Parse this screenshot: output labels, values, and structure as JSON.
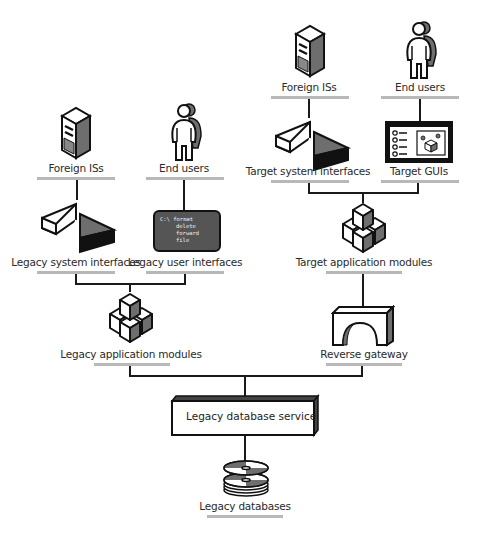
{
  "diagram": {
    "type": "architecture",
    "colors": {
      "line": "#1a1a1a",
      "underline": "#b8b8b8",
      "shade": "#6e6e6e",
      "dark": "#111111",
      "terminal": "#555555"
    },
    "left_column": {
      "foreign_iss": {
        "label": "Foreign ISs",
        "icon": "server-tower-icon"
      },
      "end_users": {
        "label": "End users",
        "icon": "user-person-icon"
      },
      "legacy_system_interfaces": {
        "label": "Legacy system interfaces",
        "icon": "interface-wedge-icon"
      },
      "legacy_user_interfaces": {
        "label": "Legacy user interfaces",
        "icon": "terminal-screen-icon",
        "terminal_lines": [
          "C:\\ format",
          "delete",
          "forward",
          "file"
        ]
      },
      "legacy_application_modules": {
        "label": "Legacy application modules",
        "icon": "stacked-cubes-icon"
      }
    },
    "right_column": {
      "foreign_iss": {
        "label": "Foreign ISs",
        "icon": "server-tower-icon"
      },
      "end_users": {
        "label": "End users",
        "icon": "user-person-icon"
      },
      "target_system_interfaces": {
        "label": "Target system interfaces",
        "icon": "interface-wedge-icon"
      },
      "target_guis": {
        "label": "Target GUIs",
        "icon": "gui-window-icon"
      },
      "target_application_modules": {
        "label": "Target application modules",
        "icon": "stacked-cubes-icon"
      },
      "reverse_gateway": {
        "label": "Reverse gateway",
        "icon": "gateway-arch-icon"
      }
    },
    "bottom": {
      "legacy_database_service": {
        "label": "Legacy database service",
        "icon": "service-box-icon"
      },
      "legacy_databases": {
        "label": "Legacy databases",
        "icon": "disk-stack-icon"
      }
    },
    "connections": [
      [
        "Foreign ISs (left)",
        "Legacy system interfaces"
      ],
      [
        "End users (left)",
        "Legacy user interfaces"
      ],
      [
        "Legacy system interfaces",
        "Legacy application modules"
      ],
      [
        "Legacy user interfaces",
        "Legacy application modules"
      ],
      [
        "Foreign ISs (right)",
        "Target system interfaces"
      ],
      [
        "End users (right)",
        "Target GUIs"
      ],
      [
        "Target system interfaces",
        "Target application modules"
      ],
      [
        "Target GUIs",
        "Target application modules"
      ],
      [
        "Target application modules",
        "Reverse gateway"
      ],
      [
        "Legacy application modules",
        "Legacy database service"
      ],
      [
        "Reverse gateway",
        "Legacy database service"
      ],
      [
        "Legacy database service",
        "Legacy databases"
      ]
    ]
  }
}
